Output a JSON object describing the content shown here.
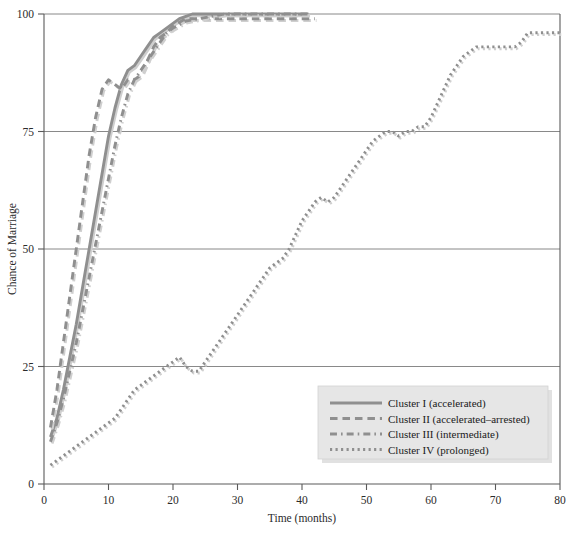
{
  "chart_data": {
    "type": "line",
    "title": "",
    "xlabel": "Time (months)",
    "ylabel": "Chance of Marriage",
    "xlim": [
      0,
      80
    ],
    "ylim": [
      0,
      100
    ],
    "xticks": [
      0,
      10,
      20,
      30,
      40,
      50,
      60,
      70,
      80
    ],
    "yticks": [
      0,
      25,
      50,
      75,
      100
    ],
    "grid": "horizontal-only",
    "legend_position": "bottom-right-inside",
    "accent_color": "#8c8c8c",
    "gridline_color": "#6b6b6b",
    "legend_background": "#e6e6e6",
    "series": [
      {
        "name": "Cluster I (accelerated)",
        "legend_label": "Cluster I (accelerated)",
        "style": "solid",
        "color": "#8f8f8f",
        "x": [
          1,
          2,
          3,
          4,
          5,
          6,
          7,
          8,
          9,
          10,
          11,
          12,
          13,
          14,
          15,
          16,
          17,
          18,
          19,
          20,
          21,
          22,
          23,
          24,
          26,
          28,
          30,
          32,
          34,
          36,
          38,
          40,
          41
        ],
        "y": [
          10,
          14,
          20,
          27,
          34,
          42,
          50,
          58,
          66,
          74,
          80,
          85,
          88,
          89,
          91,
          93,
          95,
          96,
          97,
          98,
          99,
          99.5,
          100,
          100,
          100,
          100,
          100,
          100,
          100,
          100,
          100,
          100,
          100
        ]
      },
      {
        "name": "Cluster II (accelerated-arrested)",
        "legend_label": "Cluster II (accelerated–arrested)",
        "style": "dashed",
        "color": "#8f8f8f",
        "x": [
          1,
          2,
          3,
          4,
          5,
          6,
          7,
          8,
          9,
          10,
          11,
          12,
          13,
          14,
          15,
          16,
          17,
          18,
          19,
          20,
          22,
          24,
          26,
          28,
          30,
          32,
          34,
          36,
          38,
          40,
          42
        ],
        "y": [
          12,
          20,
          30,
          40,
          50,
          60,
          70,
          78,
          84,
          86,
          85,
          84,
          86,
          86,
          87,
          90,
          93,
          95,
          96,
          97.5,
          99,
          99,
          99,
          99,
          99,
          99,
          99,
          99,
          99,
          99,
          99
        ]
      },
      {
        "name": "Cluster III (intermediate)",
        "legend_label": "Cluster III (intermediate)",
        "style": "dashdot",
        "color": "#8f8f8f",
        "x": [
          1,
          2,
          3,
          4,
          5,
          6,
          7,
          8,
          9,
          10,
          11,
          12,
          13,
          14,
          15,
          16,
          17,
          18,
          19,
          20,
          22,
          24,
          26,
          28,
          30,
          32,
          34,
          36,
          38,
          40,
          41
        ],
        "y": [
          9,
          13,
          18,
          24,
          30,
          37,
          44,
          51,
          58,
          65,
          72,
          78,
          83,
          86,
          88,
          90,
          92,
          94,
          96,
          97,
          98.5,
          99,
          99.5,
          100,
          100,
          100,
          100,
          100,
          100,
          100,
          100
        ]
      },
      {
        "name": "Cluster IV (prolonged)",
        "legend_label": "Cluster IV (prolonged)",
        "style": "dotted",
        "color": "#8f8f8f",
        "x": [
          1,
          2,
          3,
          4,
          5,
          6,
          7,
          8,
          9,
          10,
          11,
          12,
          13,
          14,
          15,
          16,
          17,
          18,
          19,
          20,
          21,
          22,
          23,
          24,
          25,
          26,
          27,
          28,
          29,
          30,
          31,
          32,
          33,
          34,
          35,
          36,
          37,
          38,
          39,
          40,
          41,
          42,
          43,
          44,
          45,
          46,
          47,
          48,
          49,
          50,
          51,
          52,
          53,
          54,
          55,
          56,
          57,
          58,
          59,
          60,
          61,
          62,
          63,
          64,
          65,
          66,
          67,
          68,
          69,
          70,
          71,
          72,
          73,
          74,
          75,
          76,
          77,
          78,
          79,
          80
        ],
        "y": [
          4,
          5,
          6,
          7,
          8,
          9,
          10,
          11,
          12,
          13,
          14,
          16,
          18,
          20,
          21,
          22,
          23,
          24,
          25,
          26,
          27,
          25,
          24,
          24,
          26,
          28,
          30,
          32,
          34,
          36,
          38,
          40,
          42,
          44,
          46,
          47,
          48,
          50,
          53,
          56,
          58,
          60,
          61,
          60,
          61,
          63,
          65,
          67,
          69,
          71,
          73,
          74,
          75,
          75,
          74,
          75,
          75,
          76,
          76,
          78,
          81,
          84,
          87,
          89,
          91,
          92,
          93,
          93,
          93,
          93,
          93,
          93,
          93,
          94,
          96,
          96,
          96,
          96,
          96,
          96
        ]
      }
    ]
  },
  "legend": {
    "items": [
      {
        "label": "Cluster I (accelerated)",
        "style": "solid"
      },
      {
        "label": "Cluster II (accelerated–arrested)",
        "style": "dashed"
      },
      {
        "label": "Cluster III (intermediate)",
        "style": "dashdot"
      },
      {
        "label": "Cluster IV (prolonged)",
        "style": "dotted"
      }
    ]
  },
  "axes": {
    "x_title": "Time (months)",
    "y_title": "Chance of Marriage",
    "x_tick_labels": [
      "0",
      "10",
      "20",
      "30",
      "40",
      "50",
      "60",
      "70",
      "80"
    ],
    "y_tick_labels": [
      "0",
      "25",
      "50",
      "75",
      "100"
    ]
  }
}
